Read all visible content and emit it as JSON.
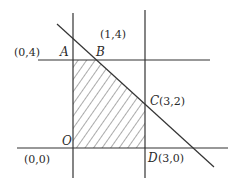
{
  "diagram": {
    "type": "linear-programming-feasible-region",
    "colors": {
      "line": "#333333",
      "hatch": "#444444",
      "background": "#ffffff"
    },
    "points": {
      "A": {
        "name": "A",
        "coord_label": "(0,4)"
      },
      "B": {
        "name": "B",
        "coord_label": "(1,4)"
      },
      "C": {
        "name": "C",
        "coord_label": "(3,2)"
      },
      "D": {
        "name": "D",
        "coord_label": "(3,0)"
      },
      "O": {
        "name": "O",
        "coord_label": "(0,0)"
      }
    },
    "lines": [
      {
        "id": "y-axis",
        "equation": "x = 0"
      },
      {
        "id": "x-axis",
        "equation": "y = 0"
      },
      {
        "id": "top-bound",
        "equation": "y = 4"
      },
      {
        "id": "right-bound",
        "equation": "x = 3"
      },
      {
        "id": "diagonal",
        "equation": "x + y = 5"
      }
    ],
    "shaded_region": {
      "vertices": [
        "O",
        "A",
        "B",
        "C",
        "D"
      ],
      "fill": "hatched"
    }
  }
}
